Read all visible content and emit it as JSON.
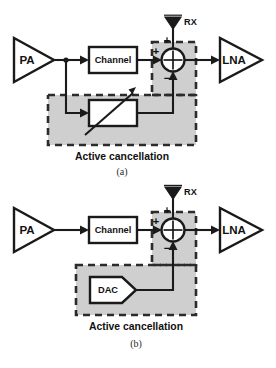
{
  "figure": {
    "type": "block-diagram",
    "title": "",
    "panels": [
      {
        "id": "a",
        "letter": "(a)",
        "caption": "Active cancellation",
        "blocks": {
          "pa": "PA",
          "channel": "Channel",
          "lna": "LNA",
          "canceller": "",
          "canceller_kind": "variable-attenuator"
        },
        "antenna_label": "RX",
        "summing_node": {
          "sign_top": "+",
          "sign_left": "+",
          "sign_bottom": "−"
        }
      },
      {
        "id": "b",
        "letter": "(b)",
        "caption": "Active cancellation",
        "blocks": {
          "pa": "PA",
          "channel": "Channel",
          "lna": "LNA",
          "canceller": "DAC",
          "canceller_kind": "dac"
        },
        "antenna_label": "RX",
        "summing_node": {
          "sign_top": "+",
          "sign_left": "+",
          "sign_bottom": "−"
        }
      }
    ]
  },
  "colors": {
    "line": "#1a1a1a",
    "shade": "#cfcfcf",
    "dash": "#2b2b2b",
    "background": "#ffffff"
  }
}
